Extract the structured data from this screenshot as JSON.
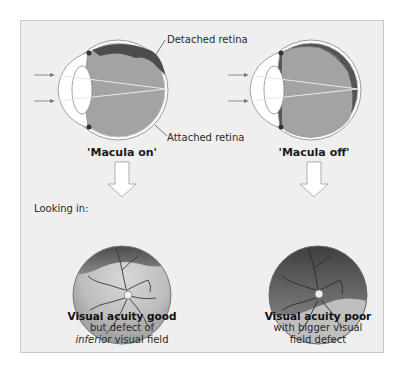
{
  "figure": {
    "labels": {
      "detached_retina": "Detached retina",
      "attached_retina": "Attached retina",
      "looking_in": "Looking in:"
    },
    "panels": [
      {
        "title": "'Macula on'",
        "caption_bold": "Visual acuity good",
        "caption_line2": "but defect of",
        "caption_italic": "inferior",
        "caption_line3_rest": " visual field"
      },
      {
        "title": "'Macula off'",
        "caption_bold": "Visual acuity poor",
        "caption_line2": "with bigger visual",
        "caption_line3": "field defect"
      }
    ],
    "colors": {
      "panel_bg": "#efefef",
      "vitreous": "#9a9a9a",
      "detached_dark": "#4a4a4a",
      "arrow_fill": "#ffffff"
    }
  }
}
